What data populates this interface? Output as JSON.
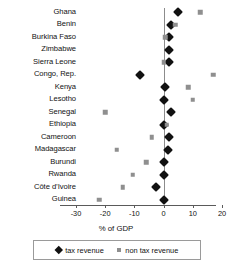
{
  "chart_data": {
    "type": "scatter",
    "title": "",
    "xlabel": "% of GDP",
    "ylabel": "",
    "xlim": [
      -30,
      20
    ],
    "xticks": [
      -30,
      -20,
      -10,
      0,
      10,
      20
    ],
    "xtick_labels": [
      "-30",
      "-20",
      "-10",
      "0",
      "10",
      "20"
    ],
    "grid": false,
    "legend_position": "bottom",
    "categories": [
      "Ghana",
      "Benin",
      "Burkina Faso",
      "Zimbabwe",
      "Sierra Leone",
      "Congo, Rep.",
      "Kenya",
      "Lesotho",
      "Senegal",
      "Ethiopia",
      "Cameroon",
      "Madagascar",
      "Burundi",
      "Rwanda",
      "Côte d’Ivoire",
      "Guinea"
    ],
    "series": [
      {
        "name": "tax revenue",
        "marker": "diamond",
        "color": "#111111",
        "values": [
          5.0,
          2.5,
          2.0,
          2.0,
          2.0,
          -8.0,
          0.5,
          0.0,
          2.5,
          0.0,
          2.0,
          1.5,
          0.0,
          0.0,
          -2.5,
          0.0
        ]
      },
      {
        "name": "non tax revenue",
        "marker": "square",
        "color": "#8f8f8f",
        "values": [
          12.5,
          4.0,
          0.5,
          null,
          0.0,
          17.0,
          8.5,
          10.0,
          -20.0,
          1.0,
          -4.0,
          -16.0,
          -6.0,
          -10.5,
          -14.0,
          -22.0
        ]
      }
    ]
  },
  "legend": {
    "items": [
      {
        "label": "tax revenue",
        "marker": "diamond"
      },
      {
        "label": "non tax revenue",
        "marker": "square"
      }
    ]
  }
}
